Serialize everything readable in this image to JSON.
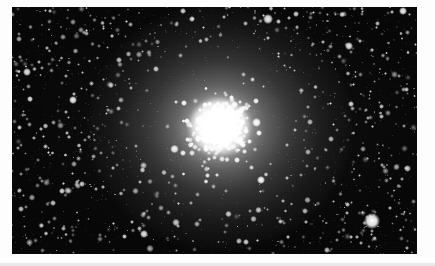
{
  "document": {
    "kind": "astronomical-photograph",
    "subject": "globular star cluster",
    "rendering": "grayscale halftone print scan",
    "page_background": "#fdfdfd",
    "page_edge_color": "#e9e9e9"
  },
  "plate": {
    "x": 12,
    "y": 7,
    "width": 405,
    "height": 247,
    "sky_color": "#060606",
    "star_color": "#ffffff",
    "border_color": "#000000"
  },
  "cluster": {
    "center_x": 220,
    "center_y": 127,
    "core_radius": 30,
    "core_color": "#ffffff",
    "halo_radius": 118,
    "halo_color": "#f2f2f2",
    "star_count_label": "dense resolved star field",
    "profile": "king-model concentration"
  },
  "field_stars": {
    "note": "prominent foreground / outer-halo stars measured from the plate",
    "bright": [
      {
        "x": 372,
        "y": 221,
        "r": 7.6,
        "b": 1.0
      },
      {
        "x": 403,
        "y": 11,
        "r": 4.2,
        "b": 0.95
      },
      {
        "x": 27,
        "y": 72,
        "r": 3.6,
        "b": 0.92
      },
      {
        "x": 30,
        "y": 99,
        "r": 3.2,
        "b": 0.9
      },
      {
        "x": 73,
        "y": 100,
        "r": 4.4,
        "b": 0.95
      },
      {
        "x": 144,
        "y": 234,
        "r": 4.0,
        "b": 0.92
      },
      {
        "x": 192,
        "y": 19,
        "r": 3.4,
        "b": 0.88
      },
      {
        "x": 268,
        "y": 19,
        "r": 4.6,
        "b": 0.95
      },
      {
        "x": 296,
        "y": 14,
        "r": 3.0,
        "b": 0.85
      },
      {
        "x": 349,
        "y": 46,
        "r": 3.8,
        "b": 0.92
      },
      {
        "x": 351,
        "y": 104,
        "r": 3.4,
        "b": 0.88
      },
      {
        "x": 62,
        "y": 191,
        "r": 3.4,
        "b": 0.88
      },
      {
        "x": 53,
        "y": 203,
        "r": 2.8,
        "b": 0.82
      },
      {
        "x": 246,
        "y": 242,
        "r": 3.2,
        "b": 0.86
      },
      {
        "x": 327,
        "y": 250,
        "r": 2.6,
        "b": 0.8
      },
      {
        "x": 407,
        "y": 248,
        "r": 2.4,
        "b": 0.78
      },
      {
        "x": 18,
        "y": 148,
        "r": 2.2,
        "b": 0.75
      },
      {
        "x": 119,
        "y": 60,
        "r": 2.8,
        "b": 0.82
      },
      {
        "x": 156,
        "y": 69,
        "r": 3.0,
        "b": 0.85
      },
      {
        "x": 239,
        "y": 241,
        "r": 2.6,
        "b": 0.8
      }
    ]
  },
  "caption": {
    "text": ""
  }
}
